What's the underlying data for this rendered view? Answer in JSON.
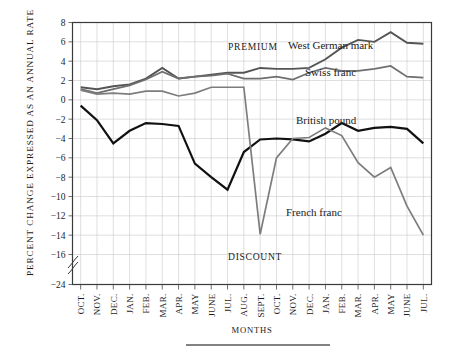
{
  "figure": {
    "ylabel": "PERCENT CHANGE EXPRESSED AS AN ANNUAL RATE",
    "xlabel": "MONTHS",
    "annotations": {
      "premium": "PREMIUM",
      "discount": "DISCOUNT",
      "west_german_mark": "West German mark",
      "swiss_franc": "Swiss franc",
      "british_pound": "British pound",
      "french_franc": "French franc"
    },
    "colors": {
      "west_german_mark": "#555555",
      "swiss_franc": "#6e6e6e",
      "british_pound": "#111111",
      "french_franc": "#7d7d7d",
      "grid": "#c9c9cf",
      "frame": "#3a3a3a"
    }
  },
  "chart_data": {
    "type": "line",
    "title": "",
    "xlabel": "MONTHS",
    "ylabel": "PERCENT CHANGE EXPRESSED AS AN ANNUAL RATE",
    "grid": true,
    "legend": "inline-annotations",
    "ylim": [
      -24,
      8
    ],
    "yticks": [
      8,
      6,
      4,
      2,
      0,
      -2,
      -4,
      -6,
      -8,
      -10,
      -12,
      -14,
      -16,
      -24
    ],
    "ytick_labels": [
      "8",
      "6",
      "4",
      "2",
      "0",
      "-2",
      "-4",
      "-6",
      "-8",
      "-10",
      "-12",
      "-14",
      "-16",
      "-24"
    ],
    "axis_break": {
      "between": [
        -16,
        -24
      ],
      "note": "y-axis broken below -16"
    },
    "categories": [
      "OCT.",
      "NOV.",
      "DEC.",
      "JAN.",
      "FEB.",
      "MAR.",
      "APR.",
      "MAY",
      "JUNE",
      "JUL.",
      "AUG.",
      "SEPT.",
      "OCT.",
      "NOV.",
      "DEC.",
      "JAN.",
      "FEB.",
      "MAR.",
      "APR.",
      "MAY",
      "JUNE",
      "JUL."
    ],
    "series": [
      {
        "name": "West German mark",
        "color": "#555555",
        "width": 1.9,
        "values": [
          1.3,
          1.1,
          1.4,
          1.6,
          2.2,
          3.3,
          2.2,
          2.4,
          2.6,
          2.8,
          2.8,
          3.3,
          3.2,
          3.2,
          3.3,
          4.2,
          5.4,
          6.2,
          6.0,
          7.0,
          5.9,
          5.8
        ]
      },
      {
        "name": "Swiss franc",
        "color": "#6e6e6e",
        "width": 1.7,
        "values": [
          1.1,
          0.7,
          1.1,
          1.5,
          2.1,
          2.9,
          2.2,
          2.4,
          2.5,
          2.7,
          2.2,
          2.2,
          2.4,
          2.1,
          2.8,
          3.3,
          3.0,
          3.0,
          3.2,
          3.5,
          2.4,
          2.3
        ]
      },
      {
        "name": "British pound",
        "color": "#111111",
        "width": 2.2,
        "values": [
          -0.6,
          -2.1,
          -4.5,
          -3.2,
          -2.4,
          -2.5,
          -2.7,
          -6.6,
          -8.0,
          -9.3,
          -5.4,
          -4.1,
          -4.0,
          -4.1,
          -4.3,
          -3.5,
          -2.4,
          -3.2,
          -2.9,
          -2.8,
          -3.0,
          -4.5
        ]
      },
      {
        "name": "French franc",
        "color": "#7d7d7d",
        "width": 1.7,
        "values": [
          1.0,
          0.6,
          0.7,
          0.6,
          0.9,
          0.9,
          0.4,
          0.7,
          1.3,
          1.3,
          1.3,
          -13.9,
          -6.0,
          -4.0,
          -3.9,
          -2.9,
          -3.7,
          -6.5,
          -8.0,
          -7.0,
          -11.0,
          -14.0
        ]
      }
    ],
    "french_franc_extra_points": [
      {
        "x_index": 10,
        "y": 1.3
      },
      {
        "x_index": 11,
        "y": -13.9
      },
      {
        "x_index": 19,
        "y": -16.2
      }
    ]
  }
}
